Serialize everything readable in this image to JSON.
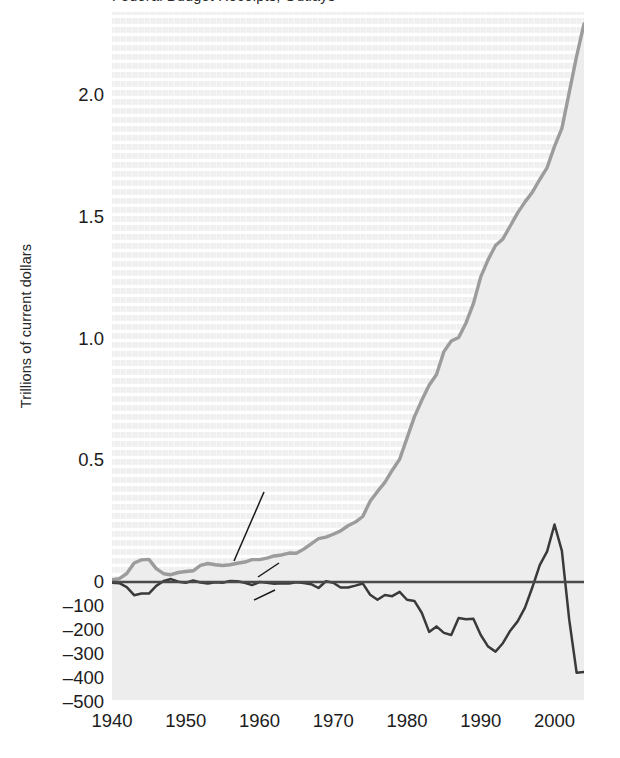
{
  "figure": {
    "cropped_title_fragment": "Federal Budget Receipts, Outlays",
    "background_color": "#ffffff",
    "plot_texture_color": "#ececec"
  },
  "axes": {
    "ylabel": "Trillions of current dollars",
    "yticks_upper": [
      "2.0",
      "1.5",
      "1.0",
      "0.5",
      "0"
    ],
    "yticks_lower": [
      "–100",
      "–200",
      "–300",
      "–400",
      "–500"
    ],
    "ytick_values_upper": [
      2.0,
      1.5,
      1.0,
      0.5,
      0
    ],
    "ytick_values_lower": [
      -100,
      -200,
      -300,
      -400,
      -500
    ],
    "xticks": [
      "1940",
      "1950",
      "1960",
      "1970",
      "1980",
      "1990",
      "2000"
    ],
    "xtick_values": [
      1940,
      1950,
      1960,
      1970,
      1980,
      1990,
      2000
    ],
    "xlim": [
      1940,
      2004
    ],
    "grid": false
  },
  "annotations": [
    {
      "name": "federal-budget",
      "label": "Federal Budget",
      "x": 210,
      "y": 478
    },
    {
      "name": "surplus",
      "label": "Surplus",
      "x": 282,
      "y": 552
    },
    {
      "name": "deficit",
      "label": "Deficit",
      "x": 278,
      "y": 588
    }
  ],
  "colors": {
    "budget_line": "#9c9c9c",
    "budget_fill": "#ededed",
    "deficit_line": "#3a3a3a",
    "zero_line": "#4a4a4a",
    "text": "#1c1c1c"
  },
  "chart_data": {
    "type": "line",
    "title": "Federal Budget Receipts, Outlays",
    "xlabel": "",
    "ylabel": "Trillions of current dollars",
    "xlim": [
      1940,
      2004
    ],
    "ylim_upper_trillions": [
      0,
      2.35
    ],
    "ylim_lower_billions": [
      -500,
      0
    ],
    "grid": false,
    "legend": "inline annotations",
    "series": [
      {
        "name": "Federal Budget",
        "units": "trillions of current dollars",
        "color": "#9c9c9c",
        "x": [
          1940,
          1941,
          1942,
          1943,
          1944,
          1945,
          1946,
          1947,
          1948,
          1949,
          1950,
          1951,
          1952,
          1953,
          1954,
          1955,
          1956,
          1957,
          1958,
          1959,
          1960,
          1961,
          1962,
          1963,
          1964,
          1965,
          1966,
          1967,
          1968,
          1969,
          1970,
          1971,
          1972,
          1973,
          1974,
          1975,
          1976,
          1977,
          1978,
          1979,
          1980,
          1981,
          1982,
          1983,
          1984,
          1985,
          1986,
          1987,
          1988,
          1989,
          1990,
          1991,
          1992,
          1993,
          1994,
          1995,
          1996,
          1997,
          1998,
          1999,
          2000,
          2001,
          2002,
          2003,
          2004
        ],
        "values": [
          0.009,
          0.014,
          0.035,
          0.078,
          0.091,
          0.093,
          0.055,
          0.034,
          0.03,
          0.039,
          0.043,
          0.046,
          0.068,
          0.076,
          0.071,
          0.068,
          0.071,
          0.077,
          0.082,
          0.092,
          0.092,
          0.098,
          0.107,
          0.111,
          0.119,
          0.118,
          0.135,
          0.157,
          0.178,
          0.184,
          0.196,
          0.21,
          0.231,
          0.246,
          0.269,
          0.332,
          0.372,
          0.409,
          0.459,
          0.504,
          0.591,
          0.678,
          0.746,
          0.808,
          0.852,
          0.946,
          0.99,
          1.004,
          1.064,
          1.143,
          1.253,
          1.324,
          1.382,
          1.409,
          1.462,
          1.516,
          1.561,
          1.601,
          1.653,
          1.702,
          1.789,
          1.863,
          2.011,
          2.16,
          2.292
        ]
      },
      {
        "name": "Surplus / Deficit",
        "units": "billions of current dollars",
        "color": "#3a3a3a",
        "x": [
          1940,
          1941,
          1942,
          1943,
          1944,
          1945,
          1946,
          1947,
          1948,
          1949,
          1950,
          1951,
          1952,
          1953,
          1954,
          1955,
          1956,
          1957,
          1958,
          1959,
          1960,
          1961,
          1962,
          1963,
          1964,
          1965,
          1966,
          1967,
          1968,
          1969,
          1970,
          1971,
          1972,
          1973,
          1974,
          1975,
          1976,
          1977,
          1978,
          1979,
          1980,
          1981,
          1982,
          1983,
          1984,
          1985,
          1986,
          1987,
          1988,
          1989,
          1990,
          1991,
          1992,
          1993,
          1994,
          1995,
          1996,
          1997,
          1998,
          1999,
          2000,
          2001,
          2002,
          2003,
          2004
        ],
        "values": [
          -3,
          -5,
          -21,
          -55,
          -48,
          -48,
          -16,
          4,
          12,
          1,
          -3,
          6,
          -2,
          -6,
          -1,
          -3,
          4,
          3,
          -3,
          -13,
          0,
          -3,
          -7,
          -5,
          -6,
          -1,
          -4,
          -9,
          -25,
          3,
          -3,
          -23,
          -23,
          -15,
          -6,
          -53,
          -74,
          -54,
          -59,
          -41,
          -74,
          -79,
          -128,
          -208,
          -185,
          -212,
          -221,
          -150,
          -155,
          -153,
          -221,
          -269,
          -290,
          -255,
          -203,
          -164,
          -107,
          -22,
          69,
          126,
          236,
          128,
          -158,
          -378,
          -375
        ]
      }
    ],
    "notes": [
      "Upper axis in trillions (0 to 2.0+); lower axis in billions (-100 to -500).",
      "Federal Budget line peaks at about 2.29 trillion at the right edge (2004).",
      "Deficit reaches about -290 billion in 1992, swings to a surplus peak of about +236 billion in 2000, then falls to about -378 billion in 2003."
    ]
  }
}
